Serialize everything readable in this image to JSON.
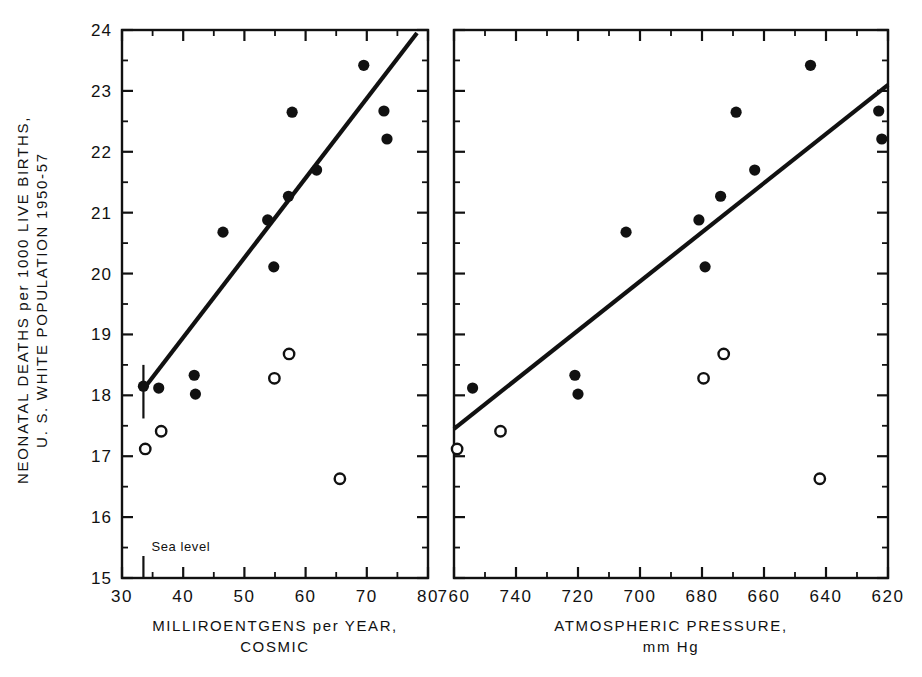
{
  "figure": {
    "background": "#ffffff",
    "ink_color": "#111111",
    "y_axis": {
      "label_line1": "NEONATAL DEATHS per 1000 LIVE BIRTHS,",
      "label_line2": "U. S. WHITE POPULATION 1950-57",
      "ticks": [
        "15",
        "16",
        "17",
        "18",
        "19",
        "20",
        "21",
        "22",
        "23",
        "24"
      ],
      "min": 15,
      "max": 24,
      "minor_step": 0.5
    },
    "panels": [
      {
        "id": "panel-cosmic",
        "xlabel_line1": "MILLIROENTGENS per YEAR,",
        "xlabel_line2": "COSMIC",
        "x_ticks": [
          "30",
          "40",
          "50",
          "60",
          "70",
          "80"
        ],
        "x_min": 30,
        "x_max": 80,
        "x_reversed": false,
        "x_minor_step": 5,
        "annotation": "Sea level",
        "annotation_x": 33.5
      },
      {
        "id": "panel-pressure",
        "xlabel_line1": "ATMOSPHERIC PRESSURE,",
        "xlabel_line2": "mm Hg",
        "x_ticks": [
          "760",
          "740",
          "720",
          "700",
          "680",
          "660",
          "640",
          "620"
        ],
        "x_min": 760,
        "x_max": 620,
        "x_reversed": true,
        "x_minor_step": 10,
        "annotation": "",
        "annotation_x": null
      }
    ]
  },
  "chart_data": [
    {
      "type": "scatter",
      "panel": "panel-cosmic",
      "title": "",
      "xlabel": "MILLIROENTGENS per YEAR, COSMIC",
      "ylabel": "NEONATAL DEATHS per 1000 LIVE BIRTHS, U. S. WHITE POPULATION 1950-57",
      "xlim": [
        30,
        80
      ],
      "ylim": [
        15,
        24
      ],
      "grid": false,
      "legend": "none",
      "annotations": [
        {
          "text": "Sea level",
          "x": 33.5,
          "y": 15.45,
          "marker": "vertical-bar"
        }
      ],
      "series": [
        {
          "name": "filled-circles",
          "marker": "filled circle",
          "points": [
            {
              "x": 33.5,
              "y": 18.15
            },
            {
              "x": 36.0,
              "y": 18.12
            },
            {
              "x": 41.8,
              "y": 18.33
            },
            {
              "x": 42.0,
              "y": 18.02
            },
            {
              "x": 46.5,
              "y": 20.68
            },
            {
              "x": 53.8,
              "y": 20.88
            },
            {
              "x": 54.8,
              "y": 20.11
            },
            {
              "x": 57.2,
              "y": 21.27
            },
            {
              "x": 57.8,
              "y": 22.65
            },
            {
              "x": 61.8,
              "y": 21.7
            },
            {
              "x": 69.5,
              "y": 23.42
            },
            {
              "x": 72.8,
              "y": 22.67
            },
            {
              "x": 73.3,
              "y": 22.21
            }
          ]
        },
        {
          "name": "open-circles",
          "marker": "open circle",
          "points": [
            {
              "x": 33.8,
              "y": 17.12
            },
            {
              "x": 36.4,
              "y": 17.41
            },
            {
              "x": 54.9,
              "y": 18.28
            },
            {
              "x": 57.3,
              "y": 18.68
            },
            {
              "x": 65.6,
              "y": 16.63
            }
          ]
        }
      ],
      "fit_line": {
        "name": "regression line",
        "x_start": 33.5,
        "y_start": 18.1,
        "x_end": 78.2,
        "y_end": 23.95
      }
    },
    {
      "type": "scatter",
      "panel": "panel-pressure",
      "title": "",
      "xlabel": "ATMOSPHERIC PRESSURE, mm Hg",
      "ylabel": "NEONATAL DEATHS per 1000 LIVE BIRTHS, U. S. WHITE POPULATION 1950-57",
      "xlim": [
        760,
        620
      ],
      "ylim": [
        15,
        24
      ],
      "grid": false,
      "legend": "none",
      "annotations": [],
      "series": [
        {
          "name": "filled-circles",
          "marker": "filled circle",
          "points": [
            {
              "x": 754.0,
              "y": 18.12
            },
            {
              "x": 721.0,
              "y": 18.33
            },
            {
              "x": 720.0,
              "y": 18.02
            },
            {
              "x": 704.5,
              "y": 20.68
            },
            {
              "x": 681.0,
              "y": 20.88
            },
            {
              "x": 679.0,
              "y": 20.11
            },
            {
              "x": 674.0,
              "y": 21.27
            },
            {
              "x": 669.0,
              "y": 22.65
            },
            {
              "x": 663.0,
              "y": 21.7
            },
            {
              "x": 645.0,
              "y": 23.42
            },
            {
              "x": 623.0,
              "y": 22.67
            },
            {
              "x": 622.0,
              "y": 22.21
            }
          ]
        },
        {
          "name": "open-circles",
          "marker": "open circle",
          "points": [
            {
              "x": 759.0,
              "y": 17.12
            },
            {
              "x": 745.0,
              "y": 17.41
            },
            {
              "x": 679.5,
              "y": 18.28
            },
            {
              "x": 673.0,
              "y": 18.68
            },
            {
              "x": 642.0,
              "y": 16.63
            }
          ]
        }
      ],
      "fit_line": {
        "name": "regression line",
        "x_start": 760.0,
        "y_start": 17.45,
        "x_end": 620.0,
        "y_end": 23.1
      }
    }
  ]
}
